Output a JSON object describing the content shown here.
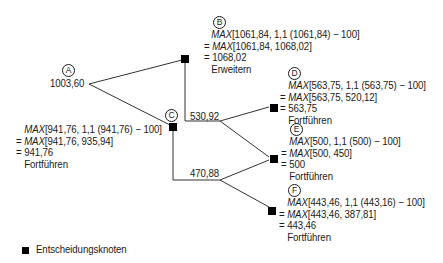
{
  "nodes": {
    "A": {
      "label": "A",
      "value": "1003,60"
    },
    "B": {
      "label": "B",
      "lines": [
        {
          "prefix": "",
          "max": "MAX",
          "rest": "[1061,84, 1,1 (1061,84) − 100]"
        },
        {
          "prefix": "= ",
          "max": "MAX",
          "rest": "[1061,84, 1068,02]"
        },
        {
          "prefix": "= ",
          "max": "",
          "rest": "1068,02"
        }
      ],
      "decision": "Erweitern"
    },
    "C": {
      "label": "C",
      "lines": [
        {
          "prefix": "",
          "max": "MAX",
          "rest": "[941,76, 1,1 (941,76) − 100]"
        },
        {
          "prefix": "= ",
          "max": "MAX",
          "rest": "[941,76, 935,94]"
        },
        {
          "prefix": "= ",
          "max": "",
          "rest": "941,76"
        }
      ],
      "decision": "Fortführen"
    },
    "D": {
      "label": "D",
      "lines": [
        {
          "prefix": "",
          "max": "MAX",
          "rest": "[563,75, 1,1 (563,75) − 100]"
        },
        {
          "prefix": "= ",
          "max": "MAX",
          "rest": "[563,75, 520,12]"
        },
        {
          "prefix": "= ",
          "max": "",
          "rest": "563,75"
        }
      ],
      "decision": "Fortführen"
    },
    "E": {
      "label": "E",
      "lines": [
        {
          "prefix": "",
          "max": "MAX",
          "rest": "[500, 1,1 (500) − 100]"
        },
        {
          "prefix": "= ",
          "max": "MAX",
          "rest": "[500, 450]"
        },
        {
          "prefix": "= ",
          "max": "",
          "rest": "500"
        }
      ],
      "decision": "Fortführen"
    },
    "F": {
      "label": "F",
      "lines": [
        {
          "prefix": "",
          "max": "MAX",
          "rest": "[443,46, 1,1 (443,16) − 100]"
        },
        {
          "prefix": "= ",
          "max": "MAX",
          "rest": "[443,46, 387,81]"
        },
        {
          "prefix": "= ",
          "max": "",
          "rest": "443,46"
        }
      ],
      "decision": "Fortführen"
    }
  },
  "branches": {
    "upper_value": "530,92",
    "lower_value": "470,88"
  },
  "legend": {
    "label": "Entscheidungsknoten"
  },
  "colors": {
    "line": "#333333",
    "node": "#000000",
    "text": "#1a1a1a"
  }
}
